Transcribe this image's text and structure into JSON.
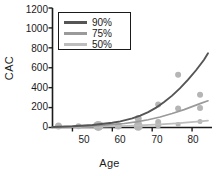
{
  "chart_data": {
    "type": "scatter",
    "title": "",
    "xlabel": "Age",
    "ylabel": "CAC",
    "xlim": [
      45,
      85
    ],
    "ylim": [
      0,
      1200
    ],
    "grid": false,
    "legend_position": "top-left",
    "xticks": [
      50,
      60,
      70,
      80
    ],
    "yticks": [
      0,
      200,
      400,
      600,
      800,
      1000,
      1200
    ],
    "colors": {
      "q90": "#555555",
      "q75": "#9a9a9a",
      "q50": "#bdbdbd",
      "points": "#b5b5b5",
      "axis": "#1a1a1a"
    },
    "legend": [
      {
        "label": "90%",
        "color": "#555555"
      },
      {
        "label": "75%",
        "color": "#9a9a9a"
      },
      {
        "label": "50%",
        "color": "#bdbdbd"
      }
    ],
    "series": [
      {
        "name": "90%",
        "type": "line",
        "color": "#555555",
        "x": [
          45,
          50,
          55,
          60,
          62,
          65,
          67,
          69,
          71,
          73,
          75,
          77,
          79,
          81,
          83,
          84
        ],
        "y": [
          5,
          12,
          25,
          48,
          62,
          92,
          120,
          155,
          200,
          255,
          320,
          395,
          480,
          575,
          680,
          745
        ]
      },
      {
        "name": "75%",
        "type": "line",
        "color": "#9a9a9a",
        "x": [
          45,
          50,
          55,
          60,
          63,
          66,
          69,
          72,
          75,
          78,
          80,
          82,
          84
        ],
        "y": [
          3,
          8,
          15,
          28,
          40,
          56,
          78,
          105,
          140,
          180,
          210,
          240,
          268
        ]
      },
      {
        "name": "50%",
        "type": "line",
        "color": "#bdbdbd",
        "x": [
          45,
          50,
          55,
          60,
          64,
          68,
          72,
          76,
          79,
          82,
          84
        ],
        "y": [
          2,
          4,
          7,
          12,
          17,
          24,
          32,
          42,
          52,
          62,
          70
        ]
      },
      {
        "name": "observations",
        "type": "scatter",
        "color": "#b5b5b5",
        "points": [
          {
            "x": 46.5,
            "y": 14,
            "size": 7
          },
          {
            "x": 51.5,
            "y": 12,
            "size": 6
          },
          {
            "x": 56.5,
            "y": 16,
            "size": 10
          },
          {
            "x": 61.5,
            "y": 14,
            "size": 7
          },
          {
            "x": 66.5,
            "y": 90,
            "size": 7
          },
          {
            "x": 66.5,
            "y": 40,
            "size": 7
          },
          {
            "x": 66.5,
            "y": 12,
            "size": 9
          },
          {
            "x": 71.5,
            "y": 230,
            "size": 6
          },
          {
            "x": 71.5,
            "y": 55,
            "size": 6
          },
          {
            "x": 71.5,
            "y": 22,
            "size": 6
          },
          {
            "x": 76.5,
            "y": 530,
            "size": 6
          },
          {
            "x": 76.5,
            "y": 190,
            "size": 6
          },
          {
            "x": 76.5,
            "y": 30,
            "size": 5
          },
          {
            "x": 82.0,
            "y": 330,
            "size": 6
          },
          {
            "x": 82.0,
            "y": 195,
            "size": 6
          },
          {
            "x": 82.0,
            "y": 60,
            "size": 5
          }
        ]
      }
    ]
  },
  "axis": {
    "ylabel": "CAC",
    "xlabel": "Age",
    "yticks": [
      "1200",
      "1000",
      "800",
      "600",
      "400",
      "200",
      "0"
    ],
    "xticks": [
      "50",
      "60",
      "70",
      "80"
    ]
  },
  "legend": {
    "items": [
      {
        "label": "90%"
      },
      {
        "label": "75%"
      },
      {
        "label": "50%"
      }
    ]
  }
}
